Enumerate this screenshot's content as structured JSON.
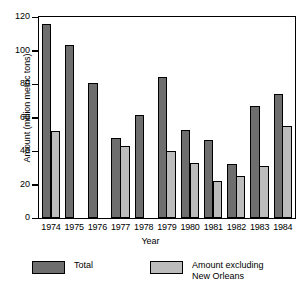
{
  "chart_data": {
    "type": "bar",
    "title": "",
    "subtitle": "",
    "xlabel": "Year",
    "ylabel": "Amount (million metric tons)",
    "categories": [
      "1974",
      "1975",
      "1976",
      "1977",
      "1978",
      "1979",
      "1980",
      "1981",
      "1982",
      "1983",
      "1984"
    ],
    "series": [
      {
        "name": "Total",
        "color": "#6e6e6e",
        "values": [
          116,
          103.5,
          81,
          48,
          61.5,
          84.5,
          53,
          47,
          32.5,
          67,
          74.5
        ]
      },
      {
        "name": "Amount excluding New Orleans",
        "color": "#bcbcbc",
        "values": [
          52,
          null,
          null,
          43.5,
          null,
          40.5,
          33,
          22.5,
          25.5,
          31.5,
          55
        ]
      }
    ],
    "ylim": [
      0,
      120
    ],
    "yticks": [
      0,
      20,
      40,
      60,
      80,
      100,
      120
    ],
    "ytick_labels": [
      "0",
      "20",
      "40",
      "60",
      "80",
      "100",
      "120"
    ],
    "grid": false,
    "legend_position": "bottom"
  },
  "legend": {
    "entries": [
      {
        "label": "Total",
        "color": "#6e6e6e"
      },
      {
        "label": "Amount excluding\nNew Orleans",
        "color": "#bcbcbc"
      }
    ]
  },
  "axes": {
    "y_title": "Amount (million metric tons)",
    "x_title": "Year"
  }
}
